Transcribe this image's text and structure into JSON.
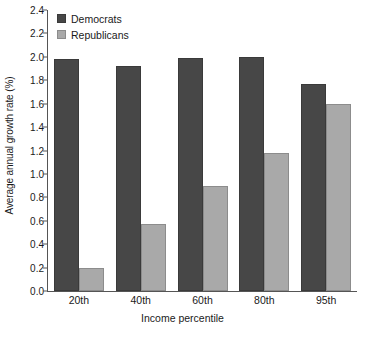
{
  "chart_data": {
    "type": "bar",
    "title": "",
    "xlabel": "Income percentile",
    "ylabel": "Average annual growth rate (%)",
    "categories": [
      "20th",
      "40th",
      "60th",
      "80th",
      "95th"
    ],
    "series": [
      {
        "name": "Democrats",
        "color": "#474747",
        "values": [
          1.98,
          1.92,
          1.99,
          2.0,
          1.77
        ]
      },
      {
        "name": "Republicans",
        "color": "#a9a9a9",
        "values": [
          0.2,
          0.57,
          0.9,
          1.18,
          1.6
        ]
      }
    ],
    "ylim": [
      0.0,
      2.4
    ],
    "ytick_step": 0.2,
    "yticks": [
      "0.0",
      "0.2",
      "0.4",
      "0.6",
      "0.8",
      "1.0",
      "1.2",
      "1.4",
      "1.6",
      "1.8",
      "2.0",
      "2.2",
      "2.4"
    ],
    "grid": false,
    "legend_position": "top-left"
  },
  "legend": {
    "items": [
      {
        "label": "Democrats"
      },
      {
        "label": "Republicans"
      }
    ]
  },
  "axes": {
    "y_title": "Average annual growth rate (%)",
    "x_title": "Income percentile"
  }
}
